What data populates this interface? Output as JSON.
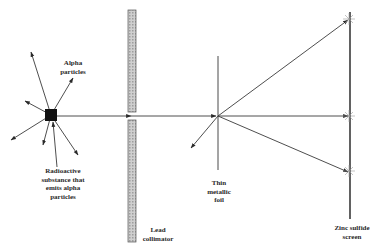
{
  "diagram": {
    "labels": {
      "alpha_particles": "Alpha\nparticles",
      "source": "Radioactive\nsubstance that\nemits alpha\nparticles",
      "collimator": "Lead\ncollimator",
      "foil": "Thin\nmetallic\nfoil",
      "screen": "Zinc sulfide\nscreen"
    },
    "colors": {
      "line": "#3a3a3a",
      "source_fill": "#111111",
      "collimator_fill": "#bdbdbd",
      "flash": "#9a9a9a"
    },
    "components": [
      {
        "id": "source",
        "type": "square",
        "x": 51,
        "y": 115,
        "size": 12
      },
      {
        "id": "collimator",
        "type": "bar",
        "x": 128,
        "y": 10,
        "width": 8,
        "height": 232
      },
      {
        "id": "foil",
        "type": "line",
        "x": 218,
        "y1": 56,
        "y2": 170
      },
      {
        "id": "screen",
        "type": "line",
        "x": 350,
        "y1": 12,
        "y2": 219
      }
    ],
    "beams": [
      {
        "from": "source",
        "to": "foil",
        "note": "collimated beam passes through slit"
      },
      {
        "from": "foil",
        "to": [
          348,
          20
        ],
        "note": "large-angle deflection up"
      },
      {
        "from": "foil",
        "to": [
          348,
          116
        ],
        "note": "undeflected"
      },
      {
        "from": "foil",
        "to": [
          348,
          172
        ],
        "note": "small deflection down"
      },
      {
        "from": "foil",
        "to": [
          191,
          148
        ],
        "note": "back-scatter"
      }
    ]
  }
}
